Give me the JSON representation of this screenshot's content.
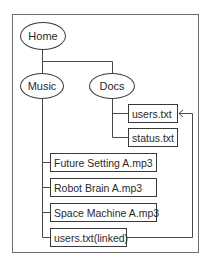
{
  "diagram": {
    "type": "file-system-tree-with-link",
    "nodes": {
      "home": {
        "label": "Home",
        "shape": "ellipse"
      },
      "music": {
        "label": "Music",
        "shape": "ellipse"
      },
      "docs": {
        "label": "Docs",
        "shape": "ellipse"
      }
    },
    "docs_files": [
      {
        "label": "users.txt"
      },
      {
        "label": "status.txt"
      }
    ],
    "music_files": [
      {
        "label": "Future Setting A.mp3"
      },
      {
        "label": "Robot Brain A.mp3"
      },
      {
        "label": "Space Machine A.mp3"
      },
      {
        "label": "users.txt(linked)"
      }
    ],
    "link": {
      "from": "users.txt(linked)",
      "to": "users.txt"
    },
    "colors": {
      "line": "#4a4a4a",
      "border": "#6e6e6e",
      "text": "#2a2a2a",
      "background": "#ffffff"
    }
  }
}
